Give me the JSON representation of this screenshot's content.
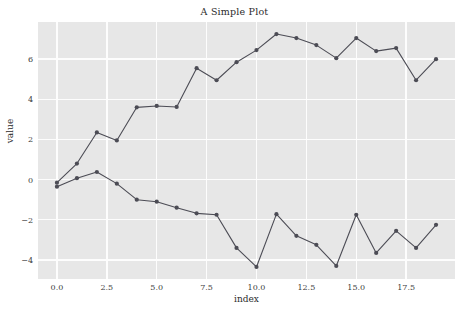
{
  "chart_data": {
    "type": "line",
    "title": "A Simple Plot",
    "xlabel": "index",
    "ylabel": "value",
    "grid": true,
    "legend": "none",
    "xlim": [
      -0.95,
      19.95
    ],
    "ylim": [
      -4.95,
      7.85
    ],
    "xticks": [
      "0.0",
      "2.5",
      "5.0",
      "7.5",
      "10.0",
      "12.5",
      "15.0",
      "17.5"
    ],
    "xtick_values": [
      0.0,
      2.5,
      5.0,
      7.5,
      10.0,
      12.5,
      15.0,
      17.5
    ],
    "yticks": [
      "6",
      "4",
      "2",
      "0",
      "−2",
      "−4"
    ],
    "ytick_values": [
      6,
      4,
      2,
      0,
      -2,
      -4
    ],
    "x": [
      0,
      1,
      2,
      3,
      4,
      5,
      6,
      7,
      8,
      9,
      10,
      11,
      12,
      13,
      14,
      15,
      16,
      17,
      18,
      19
    ],
    "series": [
      {
        "name": "upper",
        "color": "#4c4c55",
        "values": [
          -0.15,
          0.8,
          2.35,
          1.95,
          3.6,
          3.67,
          3.62,
          5.55,
          4.95,
          5.85,
          6.45,
          7.25,
          7.05,
          6.7,
          6.05,
          7.05,
          6.4,
          6.55,
          4.95,
          6.0
        ]
      },
      {
        "name": "lower",
        "color": "#4c4c55",
        "values": [
          -0.35,
          0.07,
          0.38,
          -0.2,
          -1.0,
          -1.1,
          -1.4,
          -1.68,
          -1.75,
          -3.4,
          -4.35,
          -1.72,
          -2.8,
          -3.25,
          -4.3,
          -1.75,
          -3.65,
          -2.55,
          -3.4,
          -2.25
        ]
      }
    ],
    "style": {
      "axes_facecolor": "#e7e7e7",
      "grid_color": "#fdfdfd",
      "figure_facecolor": "#ffffff",
      "marker": "circle",
      "marker_size": 4.2,
      "line_width": 1.1
    }
  }
}
